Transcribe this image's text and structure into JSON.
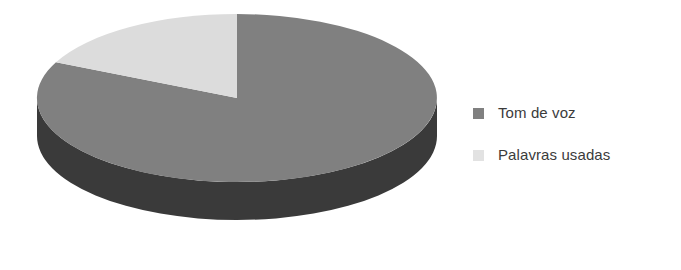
{
  "chart_data": {
    "type": "pie",
    "title": "",
    "subtitle": "",
    "xlabel": "",
    "ylabel": "",
    "three_d": true,
    "grid": false,
    "legend_position": "right",
    "categories": [
      "Tom de voz",
      "Palavras usadas"
    ],
    "values": [
      82,
      18
    ],
    "units": "percent",
    "slices": [
      {
        "label": "Tom de voz",
        "value": 82,
        "color": "#808080",
        "side_color": "#3a3a3a"
      },
      {
        "label": "Palavras usadas",
        "value": 18,
        "color": "#dcdcdc",
        "side_color": "#9a9a9a"
      }
    ]
  },
  "legend": {
    "items": [
      {
        "label": "Tom de voz",
        "swatch_color": "#808080",
        "swatch_icon": "square-swatch-icon"
      },
      {
        "label": "Palavras usadas",
        "swatch_color": "#e2e2e2",
        "swatch_icon": "square-swatch-icon"
      }
    ]
  },
  "colors": {
    "background": "#ffffff",
    "text": "#3b3b3b",
    "slice_primary": "#808080",
    "slice_primary_side": "#3a3a3a",
    "slice_secondary": "#dcdcdc",
    "slice_secondary_side": "#9a9a9a"
  }
}
